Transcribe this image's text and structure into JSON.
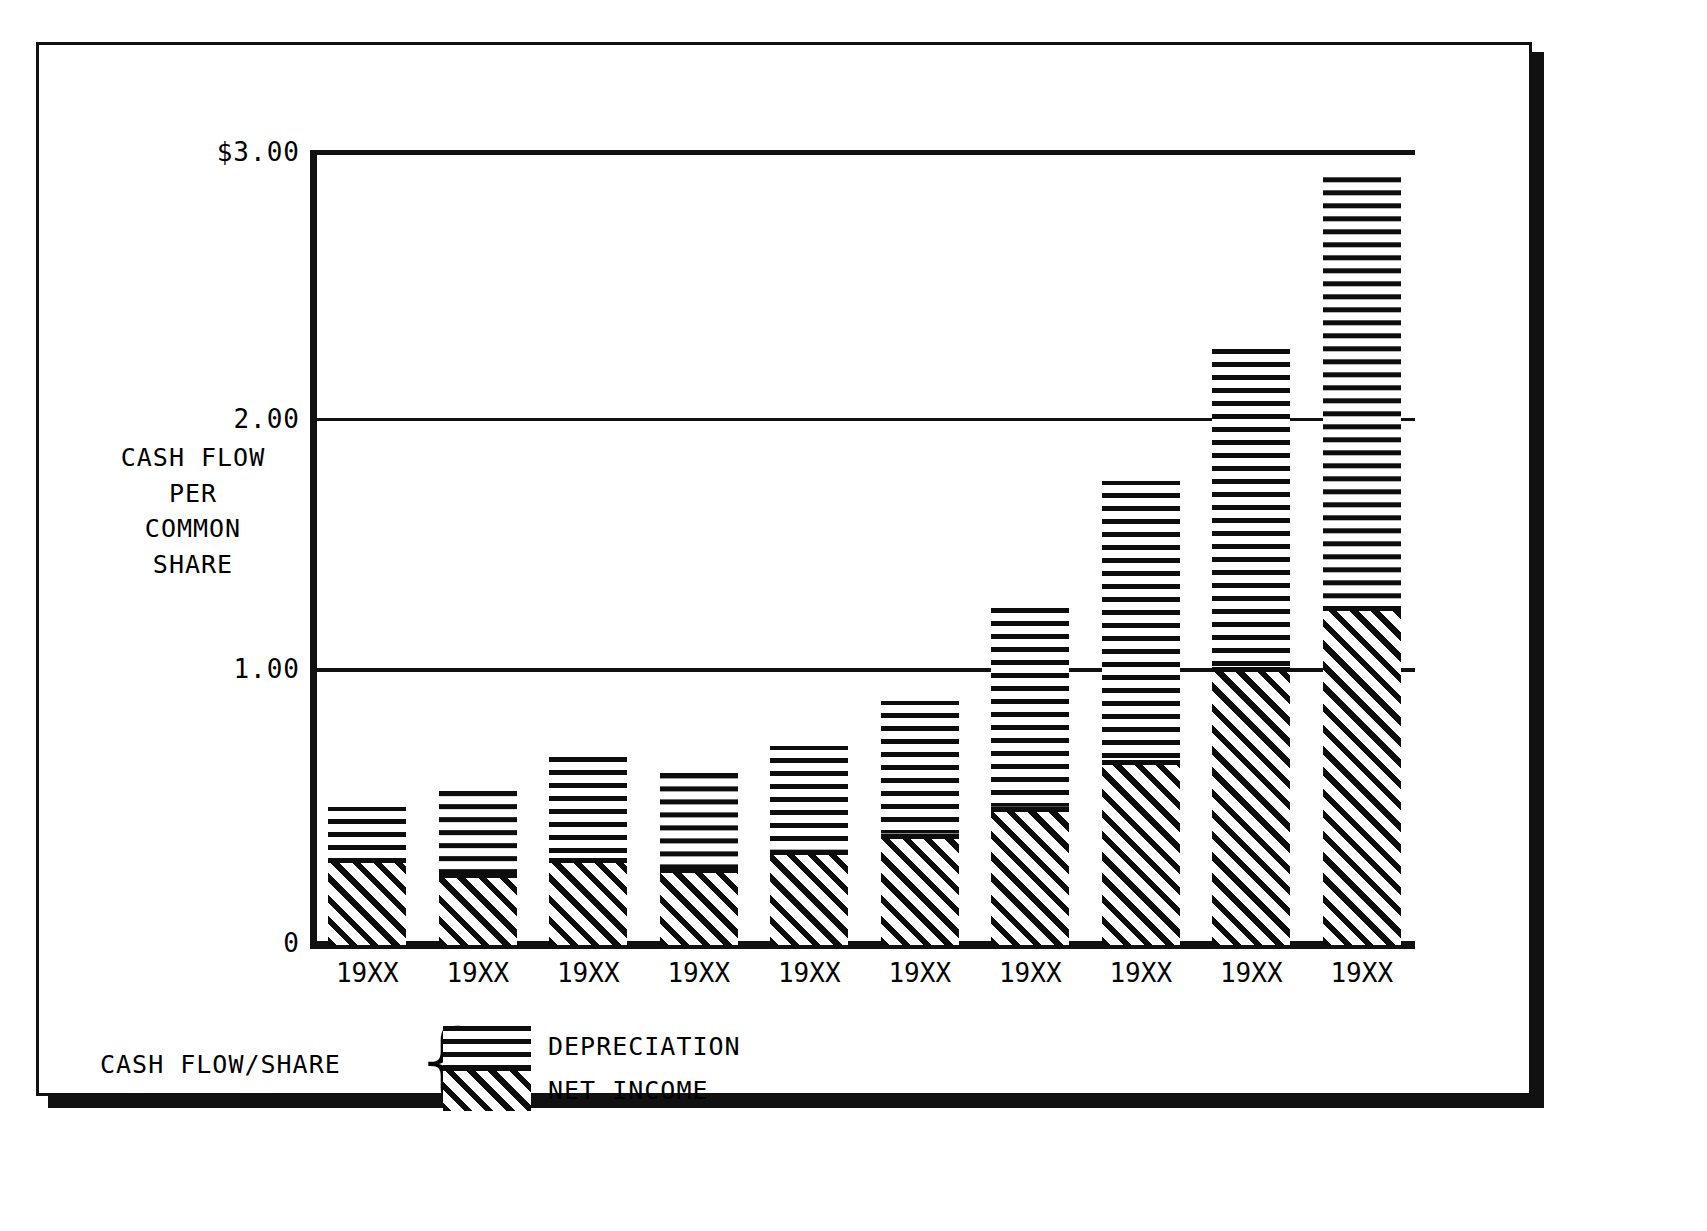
{
  "figure": {
    "axis_title_lines": [
      "CASH FLOW",
      "PER",
      "COMMON",
      "SHARE"
    ],
    "zero_label": "0"
  },
  "legend": {
    "title": "CASH FLOW/SHARE",
    "brace": "{",
    "depreciation_label": "DEPRECIATION",
    "net_income_label": "NET INCOME"
  },
  "chart_data": {
    "type": "bar",
    "subtype": "stacked-vertical",
    "title": "",
    "xlabel": "",
    "ylabel": "CASH FLOW PER COMMON SHARE",
    "ylim": [
      0,
      3.0
    ],
    "ytick_labels": [
      "$3.00",
      "2.00",
      "1.00",
      "0"
    ],
    "ytick_values": [
      3.0,
      2.0,
      1.0,
      0
    ],
    "grid": "horizontal gridlines at 1.00 and 2.00; top rule at 3.00",
    "legend_position": "below-plot-left",
    "categories": [
      "19XX",
      "19XX",
      "19XX",
      "19XX",
      "19XX",
      "19XX",
      "19XX",
      "19XX",
      "19XX",
      "19XX"
    ],
    "series": [
      {
        "name": "NET INCOME",
        "fill": "diagonal-hatch",
        "values": [
          0.33,
          0.27,
          0.33,
          0.29,
          0.36,
          0.42,
          0.52,
          0.7,
          1.05,
          1.28
        ]
      },
      {
        "name": "DEPRECIATION",
        "fill": "horizontal-hatch",
        "values": [
          0.19,
          0.31,
          0.38,
          0.36,
          0.39,
          0.5,
          0.75,
          1.05,
          1.2,
          1.62
        ]
      }
    ],
    "totals": [
      0.52,
      0.58,
      0.71,
      0.65,
      0.75,
      0.92,
      1.27,
      1.75,
      2.25,
      2.9
    ],
    "colors": {
      "ink": "#0d0d0d",
      "background": "#ffffff"
    }
  }
}
